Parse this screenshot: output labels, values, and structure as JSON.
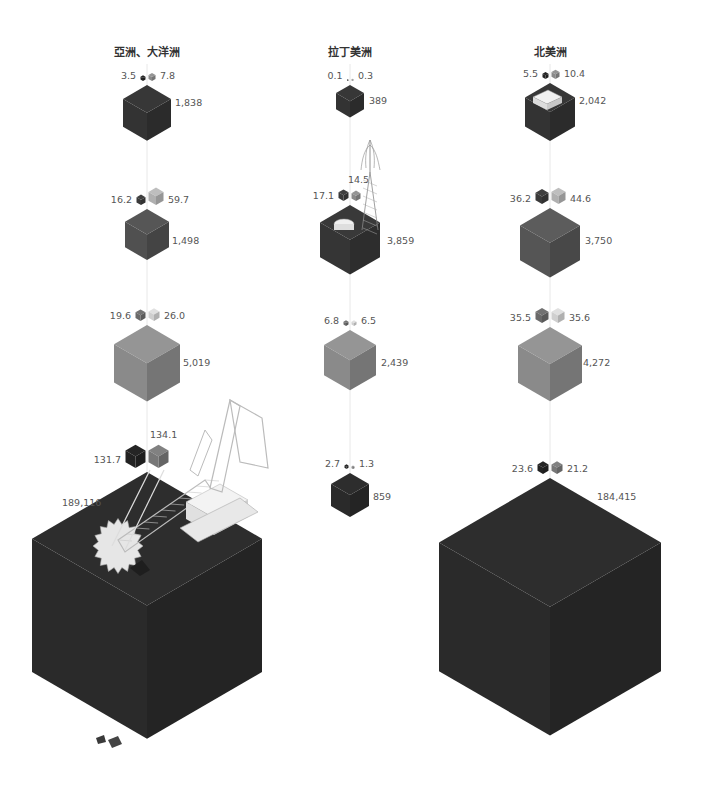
{
  "chart_data": {
    "type": "isometric-cube-chart",
    "title": "",
    "layout": {
      "columns": 3,
      "rows": 4,
      "grid": false,
      "legend": "none"
    },
    "regions": [
      {
        "name": "亞洲、大洋洲",
        "center_x": 147,
        "rows": [
          {
            "left": "3.5",
            "right": "7.8",
            "value": "1,838",
            "size": 48,
            "top": 85,
            "color": "#333333",
            "small_left_size": 5,
            "small_right_size": 7,
            "small_left_color": "#222222",
            "small_right_color": "#8a8a8a",
            "label_x": 175,
            "label_y": 106,
            "icon": ""
          },
          {
            "left": "16.2",
            "right": "59.7",
            "value": "1,498",
            "size": 44,
            "top": 209,
            "color": "#505050",
            "small_left_size": 9,
            "small_right_size": 15,
            "small_left_color": "#3a3a3a",
            "small_right_color": "#b0b0b0",
            "label_x": 172,
            "label_y": 244,
            "icon": ""
          },
          {
            "left": "19.6",
            "right": "26.0",
            "value": "5,019",
            "size": 66,
            "top": 325,
            "color": "#8a8a8a",
            "small_left_size": 10,
            "small_right_size": 11,
            "small_left_color": "#6a6a6a",
            "small_right_color": "#cfcfcf",
            "label_x": 183,
            "label_y": 366,
            "icon": ""
          },
          {
            "left": "131.7",
            "right": "134.1",
            "value": "189,116",
            "size": 230,
            "top": 472,
            "color": "#2a2a2a",
            "small_left_size": 20,
            "small_right_size": 20,
            "small_left_color": "#222222",
            "small_right_color": "#777777",
            "label_x": 62,
            "label_y": 506,
            "icon": "bucket-wheel-excavator"
          }
        ]
      },
      {
        "name": "拉丁美洲",
        "center_x": 350,
        "rows": [
          {
            "left": "0.1",
            "right": "0.3",
            "value": "389",
            "size": 28,
            "top": 85,
            "color": "#333333",
            "small_left_size": 1.5,
            "small_right_size": 2,
            "small_left_color": "#222222",
            "small_right_color": "#8a8a8a",
            "label_x": 369,
            "label_y": 104,
            "icon": ""
          },
          {
            "left": "17.1",
            "right": "14.5",
            "value": "3,859",
            "size": 60,
            "top": 205,
            "color": "#353535",
            "small_left_size": 10,
            "small_right_size": 9,
            "small_left_color": "#3a3a3a",
            "small_right_color": "#8a8a8a",
            "label_x": 387,
            "label_y": 244,
            "icon": "oil-rig-and-tank"
          },
          {
            "left": "6.8",
            "right": "6.5",
            "value": "2,439",
            "size": 52,
            "top": 330,
            "color": "#8a8a8a",
            "small_left_size": 5,
            "small_right_size": 5,
            "small_left_color": "#6a6a6a",
            "small_right_color": "#cfcfcf",
            "label_x": 381,
            "label_y": 366,
            "icon": ""
          },
          {
            "left": "2.7",
            "right": "1.3",
            "value": "859",
            "size": 38,
            "top": 473,
            "color": "#2a2a2a",
            "small_left_size": 4,
            "small_right_size": 3,
            "small_left_color": "#222222",
            "small_right_color": "#888888",
            "label_x": 373,
            "label_y": 500,
            "icon": ""
          }
        ]
      },
      {
        "name": "北美洲",
        "center_x": 550,
        "rows": [
          {
            "left": "5.5",
            "right": "10.4",
            "value": "2,042",
            "size": 50,
            "top": 83,
            "color": "#333333",
            "small_left_size": 6,
            "small_right_size": 8,
            "small_left_color": "#222222",
            "small_right_color": "#8a8a8a",
            "label_x": 579,
            "label_y": 104,
            "icon": "refinery"
          },
          {
            "left": "36.2",
            "right": "44.6",
            "value": "3,750",
            "size": 60,
            "top": 208,
            "color": "#555555",
            "small_left_size": 13,
            "small_right_size": 14,
            "small_left_color": "#3a3a3a",
            "small_right_color": "#b0b0b0",
            "label_x": 585,
            "label_y": 244,
            "icon": ""
          },
          {
            "left": "35.5",
            "right": "35.6",
            "value": "4,272",
            "size": 64,
            "top": 327,
            "color": "#8a8a8a",
            "small_left_size": 13,
            "small_right_size": 13,
            "small_left_color": "#6a6a6a",
            "small_right_color": "#cfcfcf",
            "label_x": 583,
            "label_y": 366,
            "icon": ""
          },
          {
            "left": "23.6",
            "right": "21.2",
            "value": "184,415",
            "size": 222,
            "top": 478,
            "color": "#2a2a2a",
            "small_left_size": 11,
            "small_right_size": 11,
            "small_left_color": "#222222",
            "small_right_color": "#777777",
            "label_x": 597,
            "label_y": 500,
            "icon": ""
          }
        ]
      }
    ]
  }
}
